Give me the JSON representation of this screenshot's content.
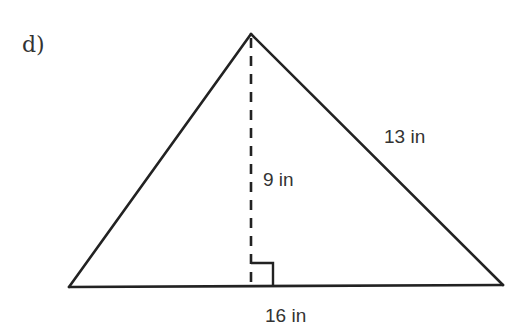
{
  "problem": {
    "label": "d)"
  },
  "triangle": {
    "shape": "triangle",
    "labels": {
      "base": "16 in",
      "height": "9 in",
      "side": "13 in"
    },
    "measurements": {
      "base_in": 16,
      "height_in": 9,
      "side_in": 13
    },
    "right_angle_marker": true,
    "height_line_style": "dashed"
  }
}
